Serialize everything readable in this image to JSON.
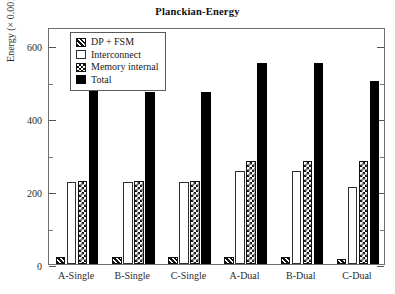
{
  "chart_data": {
    "type": "bar",
    "title": "Planckian-Energy",
    "xlabel": "",
    "ylabel": "Energy (× 0.001 uJ)",
    "ylim": [
      0,
      650
    ],
    "yticks": [
      0,
      200,
      400,
      600
    ],
    "ytick_labels": [
      "0",
      "200",
      "400",
      "600"
    ],
    "yminor_ticks": [
      100,
      300,
      500
    ],
    "grid": false,
    "legend_position": "upper left",
    "categories": [
      "A-Single",
      "B-Single",
      "C-Single",
      "A-Dual",
      "B-Dual",
      "C-Dual"
    ],
    "series": [
      {
        "name": "DP + FSM",
        "pattern": "diagonal-hatch",
        "values": [
          20,
          20,
          20,
          20,
          20,
          14
        ]
      },
      {
        "name": "Interconnect",
        "pattern": "empty",
        "values": [
          225,
          225,
          225,
          255,
          255,
          210
        ]
      },
      {
        "name": "Memory internal",
        "pattern": "checkerboard",
        "values": [
          228,
          228,
          228,
          282,
          282,
          282
        ]
      },
      {
        "name": "Total",
        "pattern": "solid-black",
        "values": [
          480,
          472,
          471,
          551,
          551,
          501
        ]
      }
    ]
  },
  "colors": {
    "frame": "#6f6f6f",
    "ink": "#111111",
    "background": "#ffffff"
  }
}
